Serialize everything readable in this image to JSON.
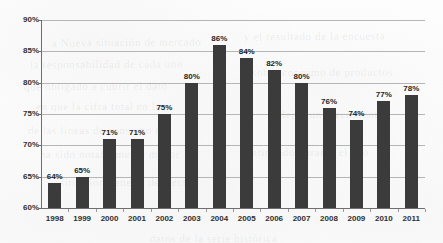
{
  "chart_data": {
    "type": "bar",
    "title": "",
    "xlabel": "",
    "ylabel": "",
    "categories": [
      "1998",
      "1999",
      "2000",
      "2001",
      "2002",
      "2003",
      "2004",
      "2005",
      "2006",
      "2007",
      "2008",
      "2009",
      "2010",
      "2011"
    ],
    "values": [
      64,
      65,
      71,
      71,
      75,
      80,
      86,
      84,
      82,
      80,
      76,
      74,
      77,
      78
    ],
    "data_labels": [
      "64%",
      "65%",
      "71%",
      "71%",
      "75%",
      "80%",
      "86%",
      "84%",
      "82%",
      "80%",
      "76%",
      "74%",
      "77%",
      "78%"
    ],
    "ylim": [
      60,
      90
    ],
    "ytick_values": [
      60,
      65,
      70,
      75,
      80,
      85,
      90
    ],
    "ytick_labels": [
      "60%",
      "65%",
      "70%",
      "75%",
      "80%",
      "85%",
      "90%"
    ],
    "grid": true,
    "legend": "none",
    "bar_color": "#3b3b3b",
    "gridline_color": "#b5b5b5",
    "axis_color": "#6e6e6e",
    "background_color": "#fdfdfd"
  },
  "bleed_text": [
    {
      "text": "a   Nueva  situación   de  mercado",
      "x": 52,
      "y": 36,
      "rot": -0.5
    },
    {
      "text": "la responsabilidad  de  cada  uno",
      "x": 30,
      "y": 58,
      "rot": -0.4
    },
    {
      "text": "que  obligado  a  cubrir   el   dato",
      "x": 24,
      "y": 80,
      "rot": -0.4
    },
    {
      "text": "en  que   la  cifra  total  en   los",
      "x": 36,
      "y": 100,
      "rot": -0.3
    },
    {
      "text": "de  las  lineas  de  consumo  en",
      "x": 28,
      "y": 124,
      "rot": -0.3
    },
    {
      "text": "ha   sido   notablemente    mayor",
      "x": 40,
      "y": 148,
      "rot": -0.3
    },
    {
      "text": "y  el  resultado  de  la  encuesta",
      "x": 244,
      "y": 30,
      "rot": -0.4
    },
    {
      "text": "sobre   consumo   de   productos",
      "x": 252,
      "y": 66,
      "rot": -0.3
    },
    {
      "text": "reflejan    un     crecimiento",
      "x": 268,
      "y": 108,
      "rot": -0.3
    },
    {
      "text": "continuado   durante   el   año",
      "x": 240,
      "y": 146,
      "rot": -0.3
    },
    {
      "text": "situación    general    del    sector",
      "x": 60,
      "y": 176,
      "rot": -0.2
    },
    {
      "text": "datos   de   la   serie   histórica",
      "x": 150,
      "y": 232,
      "rot": -0.2
    }
  ]
}
